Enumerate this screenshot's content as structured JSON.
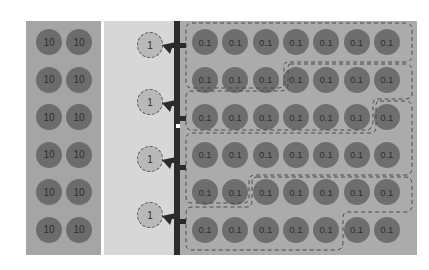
{
  "diagram": {
    "left_panel": {
      "label_value": "10",
      "rows": 6,
      "cols": 2,
      "cells": [
        [
          "10",
          "10"
        ],
        [
          "10",
          "10"
        ],
        [
          "10",
          "10"
        ],
        [
          "10",
          "10"
        ],
        [
          "10",
          "10"
        ],
        [
          "10",
          "10"
        ]
      ]
    },
    "middle_panel": {
      "sources": [
        {
          "label": "1"
        },
        {
          "label": "1"
        },
        {
          "label": "1"
        },
        {
          "label": "1"
        }
      ]
    },
    "right_panel": {
      "rows": 6,
      "cols": 7,
      "cells": [
        [
          "0.1",
          "0.1",
          "0.1",
          "0.1",
          "0.1",
          "0.1",
          "0.1"
        ],
        [
          "0.1",
          "0.1",
          "0.1",
          "0.1",
          "0.1",
          "0.1",
          "0.1"
        ],
        [
          "0.1",
          "0.1",
          "0.1",
          "0.1",
          "0.1",
          "0.1",
          "0.1"
        ],
        [
          "0.1",
          "0.1",
          "0.1",
          "0.1",
          "0.1",
          "0.1",
          "0.1"
        ],
        [
          "0.1",
          "0.1",
          "0.1",
          "0.1",
          "0.1",
          "0.1",
          "0.1"
        ],
        [
          "0.1",
          "0.1",
          "0.1",
          "0.1",
          "0.1",
          "0.1",
          "0.1"
        ]
      ],
      "groups": 4
    },
    "colors": {
      "left_panel": "#a5a5a5",
      "middle_panel": "#d7d7d7",
      "right_panel": "#ababab",
      "bar": "#2b2b2b",
      "circle_dark": "#6c6c6c",
      "circle_light": "#b9b9b9"
    }
  }
}
